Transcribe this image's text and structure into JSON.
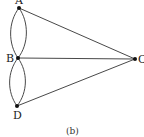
{
  "diagram": {
    "type": "multigraph",
    "caption": "(b)",
    "nodes": [
      {
        "id": "A",
        "label": "A",
        "x": 19,
        "y": 8
      },
      {
        "id": "B",
        "label": "B",
        "x": 18,
        "y": 58
      },
      {
        "id": "C",
        "label": "C",
        "x": 135,
        "y": 59
      },
      {
        "id": "D",
        "label": "D",
        "x": 17,
        "y": 106
      }
    ],
    "edges": [
      {
        "from": "A",
        "to": "B",
        "shape": "arc-left"
      },
      {
        "from": "A",
        "to": "B",
        "shape": "arc-right"
      },
      {
        "from": "B",
        "to": "D",
        "shape": "arc-left"
      },
      {
        "from": "B",
        "to": "D",
        "shape": "arc-right"
      },
      {
        "from": "A",
        "to": "C",
        "shape": "line"
      },
      {
        "from": "B",
        "to": "C",
        "shape": "line"
      },
      {
        "from": "D",
        "to": "C",
        "shape": "line"
      }
    ],
    "colors": {
      "line": "#333333",
      "node": "#111111",
      "background": "#ffffff"
    }
  }
}
